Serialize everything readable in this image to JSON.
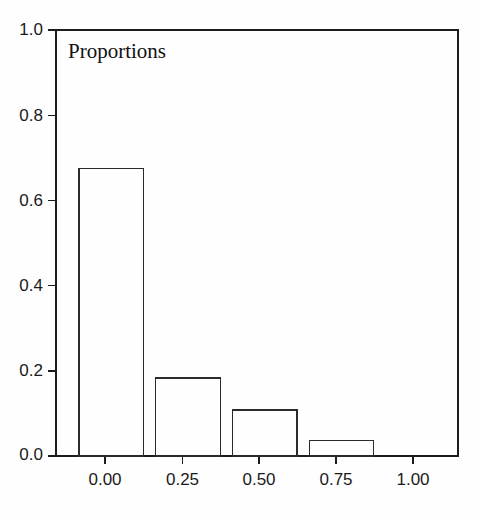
{
  "chart_data": {
    "type": "bar",
    "title": "Proportions",
    "xlabel": "",
    "ylabel": "",
    "categories": [
      "0.00",
      "0.25",
      "0.50",
      "0.75"
    ],
    "x": [
      0.0,
      0.25,
      0.5,
      0.75
    ],
    "values": [
      0.675,
      0.183,
      0.108,
      0.037
    ],
    "bar_width": 0.21,
    "xlim": [
      -0.18,
      1.13
    ],
    "ylim": [
      0.0,
      1.0
    ],
    "xticks": [
      0.0,
      0.25,
      0.5,
      0.75,
      1.0
    ],
    "xtick_labels": [
      "0.00",
      "0.25",
      "0.50",
      "0.75",
      "1.00"
    ],
    "yticks": [
      0.0,
      0.2,
      0.4,
      0.6,
      0.8,
      1.0
    ],
    "ytick_labels": [
      "0.0",
      "0.2",
      "0.4",
      "0.6",
      "0.8",
      "1.0"
    ],
    "grid": false,
    "legend": null,
    "bar_fill": "none",
    "bar_edge_color": "#2b2b2b",
    "axis_color": "#1c1c1c",
    "background": "#fefefe"
  },
  "figure": {
    "title_text": "Proportions"
  }
}
